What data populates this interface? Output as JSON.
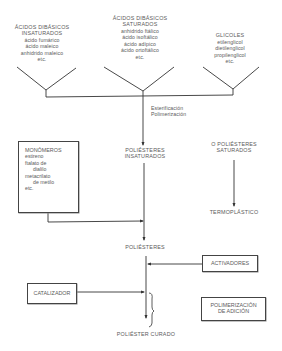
{
  "diagram": {
    "groups": [
      {
        "title": [
          "ÁCIDOS DIBÁSICOS",
          "INSATURADOS"
        ],
        "items": [
          "ácido fumárico",
          "ácido maleico",
          "anhidrido maleico",
          "etc."
        ]
      },
      {
        "title": [
          "ÁCIDOS DIBÁSICOS",
          "SATURADOS"
        ],
        "items": [
          "anhidrido ftálico",
          "ácido isoftálico",
          "ácido adípico",
          "ácido ortoftálico",
          "etc."
        ]
      },
      {
        "title": [
          "GLICOLES"
        ],
        "items": [
          "etilenglicol",
          "dietilenglicol",
          "propilenglicol",
          "etc."
        ]
      }
    ],
    "process_label": [
      "Esterificación",
      "Polimerización"
    ],
    "monomeros": {
      "title": "MONÓMEROS",
      "items": [
        "estireno",
        "ftalato de",
        "dialilo",
        "metacrilato",
        "de metilo",
        "etc."
      ]
    },
    "poliesteres_insaturados": [
      "POLIÉSTERES",
      "INSATURADOS"
    ],
    "poliesteres_saturados": [
      "O POLIÉSTERES",
      "SATURADOS"
    ],
    "termoplastico": "TERMOPLÁSTICO",
    "poliesteres": "POLIÉSTERES",
    "activadores": "ACTIVADORES",
    "catalizador": "CATALIZADOR",
    "polimerizacion_adicion": [
      "POLIMERIZACIÓN",
      "DE ADICIÓN"
    ],
    "poliester_curado": "POLIÉSTER CURADO",
    "colors": {
      "line": "#333333",
      "text": "#5a5a5a",
      "box_border": "#444444"
    }
  }
}
